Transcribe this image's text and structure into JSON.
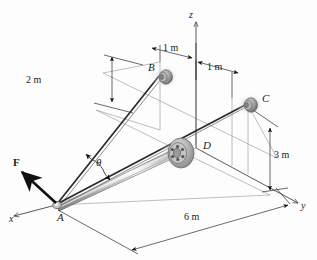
{
  "figure": {
    "background_color": "#fdfdfd",
    "line_color": "#4a4a4a",
    "dark_line_color": "#1a1a1a",
    "pipe_color": "#b8b8b8",
    "hub_color": "#9a9a9a"
  },
  "axes": {
    "x_label": "x",
    "y_label": "y",
    "z_label": "z"
  },
  "points": {
    "a_label": "A",
    "b_label": "B",
    "c_label": "C",
    "d_label": "D"
  },
  "force": {
    "label": "F"
  },
  "angle": {
    "label": "θ"
  },
  "dimensions": [
    {
      "name": "b-height",
      "label": "2 m"
    },
    {
      "name": "b-to-z-offset",
      "label": "1 m"
    },
    {
      "name": "z-to-c-offset",
      "label": "1 m"
    },
    {
      "name": "c-height",
      "label": "3 m"
    },
    {
      "name": "a-to-d-length",
      "label": "6 m"
    }
  ]
}
